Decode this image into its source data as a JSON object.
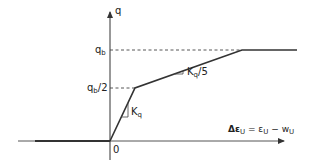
{
  "diagram": {
    "type": "trilinear load-slip curve",
    "axes": {
      "y_label": "q",
      "x_label_prefix": "Δε",
      "x_label_sub1": "U",
      "x_label_eq": " = ε",
      "x_label_sub2": "U",
      "x_label_minus": " − w",
      "x_label_sub3": "U",
      "origin_label": "0"
    },
    "levels": {
      "qb_main": "q",
      "qb_sub": "b",
      "qb_half_main": "q",
      "qb_half_sub": "b",
      "qb_half_suffix": "/2"
    },
    "slopes": {
      "first_main": "K",
      "first_sub": "q",
      "second_main": "K",
      "second_sub": "q",
      "second_suffix": "/5"
    },
    "colors": {
      "line": "#333333",
      "axis": "#333333",
      "dash": "#444444"
    }
  }
}
